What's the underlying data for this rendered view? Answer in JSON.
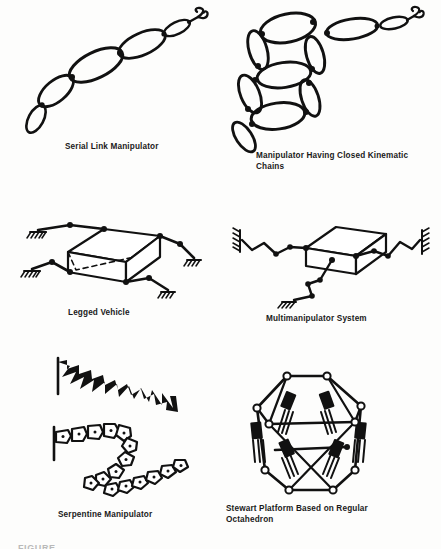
{
  "figure": {
    "label": "FIGURE",
    "ink_color": "#111111",
    "background_color": "#fdfdfc",
    "panel_count": 6
  },
  "panels": [
    {
      "id": "serial-link-manipulator",
      "caption": "Serial Link Manipulator",
      "description": "Open kinematic chain of six ellipse-shaped links of varying size rising to the upper right, terminating in a two-pronged gripper",
      "link_count": 6,
      "terminator": "gripper"
    },
    {
      "id": "closed-kinematic-chains",
      "caption": "Manipulator Having Closed Kinematic\nChains",
      "caption_lines": [
        "Manipulator Having Closed Kinematic",
        "Chains"
      ],
      "description": "Two stacked closed parallelogram loops built from ellipse links, with a serial ellipse arm extending to the upper right ending in a gripper, and a single ellipse link extending to the lower left",
      "loop_count": 2,
      "terminator": "gripper"
    },
    {
      "id": "legged-vehicle",
      "caption": "Legged Vehicle",
      "description": "Isometric rectangular body platform with four two-segment articulated legs ending in hatched ground contact symbols",
      "leg_count": 4,
      "body_shape": "rectangular-box-isometric"
    },
    {
      "id": "multimanipulator-system",
      "caption": "Multimanipulator System",
      "description": "Isometric box payload grasped by three zigzag multi-link arms anchored to hatched wall and floor supports on the left, right and bottom",
      "arm_count": 3,
      "body_shape": "rectangular-box-isometric"
    },
    {
      "id": "serpentine-manipulator",
      "caption": "Serpentine Manipulator",
      "description": "Two hyper-redundant serpentine arms in S-shaped postures; the upper built from triangular wedge segments and the lower from pentagonal block segments with joint dots, both anchored at a vertical base line on the left",
      "chain_count": 2,
      "upper_segment_shape": "triangular-wedge",
      "lower_segment_shape": "pentagonal-block"
    },
    {
      "id": "stewart-platform",
      "caption": "Stewart Platform Based on Regular\nOctahedron",
      "caption_lines": [
        "Stewart Platform Based on Regular",
        "Octahedron"
      ],
      "description": "Parallel manipulator drawn as a regular octahedron frame with six linear hydraulic actuators connecting an upper triangular platform to a lower triangular base",
      "actuator_count": 6,
      "geometry": "regular-octahedron"
    }
  ]
}
